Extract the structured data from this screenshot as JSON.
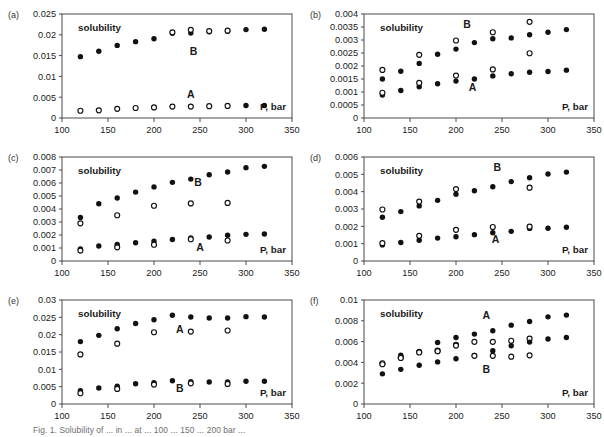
{
  "figure": {
    "width": 604,
    "height": 437,
    "caption": "Fig. 1. Solubility of ... in ... at ... 100 ... 150 ... 200 bar ...",
    "panel_order": [
      "a",
      "b",
      "c",
      "d",
      "e",
      "f"
    ]
  },
  "labels": {
    "solubility": "solubility",
    "pressure_axis": "P, bar",
    "series_a": "A",
    "series_b": "B"
  },
  "chart_data": [
    {
      "id": "a",
      "type": "scatter",
      "panel_letter": "(a)",
      "title": "",
      "xlabel": "P, bar",
      "ylabel": "solubility",
      "xlim": [
        100,
        350
      ],
      "ylim": [
        0,
        0.025
      ],
      "xticks": [
        100,
        150,
        200,
        250,
        300,
        350
      ],
      "yticks": [
        0,
        0.005,
        0.01,
        0.015,
        0.02,
        0.025
      ],
      "ytick_labels": [
        "0",
        "0.005",
        "0.01",
        "0.015",
        "0.02",
        "0.025"
      ],
      "grid": false,
      "legend": "none",
      "annotations": [
        {
          "text": "A",
          "x": 240,
          "y": 0.0048
        },
        {
          "text": "B",
          "x": 243,
          "y": 0.0152
        }
      ],
      "series": [
        {
          "name": "B-filled",
          "marker": "filled",
          "x": [
            120,
            140,
            160,
            180,
            200,
            220,
            240,
            260,
            280,
            300,
            320
          ],
          "values": [
            0.01475,
            0.01605,
            0.01745,
            0.01835,
            0.01905,
            0.02035,
            0.02045,
            0.02075,
            0.02085,
            0.02125,
            0.02135
          ]
        },
        {
          "name": "B-open",
          "marker": "open",
          "x": [
            220,
            240,
            260,
            280
          ],
          "values": [
            0.0206,
            0.0212,
            0.0209,
            0.021
          ]
        },
        {
          "name": "A-filled",
          "marker": "filled",
          "x": [
            300,
            320
          ],
          "values": [
            0.003,
            0.003
          ]
        },
        {
          "name": "A-open",
          "marker": "open",
          "x": [
            120,
            140,
            160,
            180,
            200,
            220,
            240,
            260,
            280
          ],
          "values": [
            0.00175,
            0.00185,
            0.0022,
            0.0024,
            0.00255,
            0.00275,
            0.00275,
            0.00285,
            0.0029
          ]
        }
      ]
    },
    {
      "id": "b",
      "type": "scatter",
      "panel_letter": "(b)",
      "title": "",
      "xlabel": "P, bar",
      "ylabel": "solubility",
      "xlim": [
        100,
        350
      ],
      "ylim": [
        0,
        0.004
      ],
      "xticks": [
        100,
        150,
        200,
        250,
        300,
        350
      ],
      "yticks": [
        0,
        0.0005,
        0.001,
        0.0015,
        0.002,
        0.0025,
        0.003,
        0.0035,
        0.004
      ],
      "ytick_labels": [
        "0",
        "0.0005",
        "0.001",
        "0.0015",
        "0.002",
        "0.0025",
        "0.003",
        "0.0035",
        "0.004"
      ],
      "grid": false,
      "legend": "none",
      "annotations": [
        {
          "text": "A",
          "x": 218,
          "y": 0.00105
        },
        {
          "text": "B",
          "x": 212,
          "y": 0.00345
        }
      ],
      "series": [
        {
          "name": "B-filled",
          "marker": "filled",
          "x": [
            120,
            140,
            160,
            180,
            200,
            220,
            240,
            260,
            280,
            300,
            320
          ],
          "values": [
            0.0015,
            0.0018,
            0.0021,
            0.00245,
            0.00265,
            0.0029,
            0.00305,
            0.00308,
            0.0032,
            0.0033,
            0.0034
          ]
        },
        {
          "name": "B-open",
          "marker": "open",
          "x": [
            120,
            160,
            200,
            240,
            280
          ],
          "values": [
            0.00185,
            0.00243,
            0.00298,
            0.0033,
            0.0037
          ]
        },
        {
          "name": "A-filled",
          "marker": "filled",
          "x": [
            120,
            140,
            160,
            180,
            200,
            220,
            240,
            260,
            280,
            300,
            320
          ],
          "values": [
            0.00088,
            0.00106,
            0.0012,
            0.00132,
            0.00142,
            0.0015,
            0.00162,
            0.0017,
            0.00176,
            0.00179,
            0.00184
          ]
        },
        {
          "name": "A-open",
          "marker": "open",
          "x": [
            120,
            160,
            200,
            240,
            280
          ],
          "values": [
            0.00097,
            0.00135,
            0.00163,
            0.00187,
            0.00249
          ]
        }
      ]
    },
    {
      "id": "c",
      "type": "scatter",
      "panel_letter": "(c)",
      "title": "",
      "xlabel": "P, bar",
      "ylabel": "solubility",
      "xlim": [
        100,
        350
      ],
      "ylim": [
        0,
        0.008
      ],
      "xticks": [
        100,
        150,
        200,
        250,
        300,
        350
      ],
      "yticks": [
        0,
        0.001,
        0.002,
        0.003,
        0.004,
        0.005,
        0.006,
        0.007,
        0.008
      ],
      "ytick_labels": [
        "0",
        "0.001",
        "0.002",
        "0.003",
        "0.004",
        "0.005",
        "0.006",
        "0.007",
        "0.008"
      ],
      "grid": false,
      "legend": "none",
      "annotations": [
        {
          "text": "A",
          "x": 250,
          "y": 0.00075
        },
        {
          "text": "B",
          "x": 248,
          "y": 0.0058
        }
      ],
      "series": [
        {
          "name": "B-filled",
          "marker": "filled",
          "x": [
            120,
            140,
            160,
            180,
            200,
            220,
            240,
            260,
            280,
            300,
            320
          ],
          "values": [
            0.00335,
            0.0044,
            0.00485,
            0.0053,
            0.0057,
            0.00605,
            0.0063,
            0.00663,
            0.00685,
            0.00718,
            0.00728
          ]
        },
        {
          "name": "B-open",
          "marker": "open",
          "x": [
            120,
            160,
            200,
            240,
            280
          ],
          "values": [
            0.0029,
            0.00352,
            0.00425,
            0.00443,
            0.00447
          ]
        },
        {
          "name": "A-filled",
          "marker": "filled",
          "x": [
            120,
            140,
            160,
            180,
            200,
            220,
            240,
            260,
            280,
            300,
            320
          ],
          "values": [
            0.00092,
            0.00115,
            0.00128,
            0.0014,
            0.00152,
            0.00165,
            0.00178,
            0.00185,
            0.00198,
            0.00205,
            0.00208
          ]
        },
        {
          "name": "A-open",
          "marker": "open",
          "x": [
            120,
            160,
            200,
            240,
            280
          ],
          "values": [
            0.0008,
            0.00105,
            0.00125,
            0.00167,
            0.00158
          ]
        }
      ]
    },
    {
      "id": "d",
      "type": "scatter",
      "panel_letter": "(d)",
      "title": "",
      "xlabel": "P, bar",
      "ylabel": "solubility",
      "xlim": [
        100,
        350
      ],
      "ylim": [
        0,
        0.006
      ],
      "xticks": [
        100,
        150,
        200,
        250,
        300,
        350
      ],
      "yticks": [
        0,
        0.001,
        0.002,
        0.003,
        0.004,
        0.005,
        0.006
      ],
      "ytick_labels": [
        "0",
        "0.001",
        "0.002",
        "0.003",
        "0.004",
        "0.005",
        "0.006"
      ],
      "grid": false,
      "legend": "none",
      "annotations": [
        {
          "text": "A",
          "x": 243,
          "y": 0.00105
        },
        {
          "text": "B",
          "x": 245,
          "y": 0.0052
        }
      ],
      "series": [
        {
          "name": "B-filled",
          "marker": "filled",
          "x": [
            120,
            140,
            160,
            180,
            200,
            220,
            240,
            260,
            280,
            300,
            320
          ],
          "values": [
            0.00252,
            0.00285,
            0.00318,
            0.0035,
            0.00385,
            0.00405,
            0.00428,
            0.00458,
            0.0048,
            0.00502,
            0.00513
          ]
        },
        {
          "name": "B-open",
          "marker": "open",
          "x": [
            120,
            160,
            200,
            280
          ],
          "values": [
            0.00297,
            0.00343,
            0.00415,
            0.00423
          ]
        },
        {
          "name": "A-filled",
          "marker": "filled",
          "x": [
            120,
            140,
            160,
            180,
            200,
            220,
            240,
            260,
            280,
            300,
            320
          ],
          "values": [
            0.00093,
            0.00107,
            0.0012,
            0.00132,
            0.0014,
            0.00152,
            0.00163,
            0.00171,
            0.00188,
            0.00189,
            0.00195
          ]
        },
        {
          "name": "A-open",
          "marker": "open",
          "x": [
            120,
            160,
            200,
            240,
            280
          ],
          "values": [
            0.00103,
            0.00145,
            0.0018,
            0.00196,
            0.00198
          ]
        }
      ]
    },
    {
      "id": "e",
      "type": "scatter",
      "panel_letter": "(e)",
      "title": "",
      "xlabel": "P, bar",
      "ylabel": "solubility",
      "xlim": [
        100,
        350
      ],
      "ylim": [
        0,
        0.03
      ],
      "xticks": [
        100,
        150,
        200,
        250,
        300,
        350
      ],
      "yticks": [
        0,
        0.005,
        0.01,
        0.015,
        0.02,
        0.025,
        0.03
      ],
      "ytick_labels": [
        "0",
        "0.005",
        "0.01",
        "0.015",
        "0.02",
        "0.025",
        "0.03"
      ],
      "grid": false,
      "legend": "none",
      "annotations": [
        {
          "text": "A",
          "x": 228,
          "y": 0.0205
        },
        {
          "text": "B",
          "x": 228,
          "y": 0.0035
        }
      ],
      "series": [
        {
          "name": "A-filled",
          "marker": "filled",
          "x": [
            120,
            140,
            160,
            180,
            200,
            220,
            240,
            260,
            280,
            300,
            320
          ],
          "values": [
            0.018,
            0.0198,
            0.0217,
            0.0232,
            0.0243,
            0.0256,
            0.0251,
            0.0248,
            0.0248,
            0.0252,
            0.0251
          ]
        },
        {
          "name": "A-open",
          "marker": "open",
          "x": [
            120,
            160,
            200,
            240,
            280
          ],
          "values": [
            0.0143,
            0.0174,
            0.0207,
            0.0209,
            0.0212
          ]
        },
        {
          "name": "B-filled",
          "marker": "filled",
          "x": [
            120,
            140,
            160,
            180,
            200,
            220,
            240,
            260,
            280,
            300,
            320
          ],
          "values": [
            0.00383,
            0.00462,
            0.0051,
            0.00585,
            0.00618,
            0.00672,
            0.0064,
            0.00635,
            0.00635,
            0.00655,
            0.00655
          ]
        },
        {
          "name": "B-open",
          "marker": "open",
          "x": [
            120,
            160,
            200,
            240,
            280
          ],
          "values": [
            0.0031,
            0.00435,
            0.0056,
            0.00595,
            0.0058
          ]
        }
      ]
    },
    {
      "id": "f",
      "type": "scatter",
      "panel_letter": "(f)",
      "title": "",
      "xlabel": "P, bar",
      "ylabel": "solubility",
      "xlim": [
        100,
        350
      ],
      "ylim": [
        0,
        0.01
      ],
      "xticks": [
        100,
        150,
        200,
        250,
        300,
        350
      ],
      "yticks": [
        0,
        0.002,
        0.004,
        0.006,
        0.008,
        0.01
      ],
      "ytick_labels": [
        "0",
        "0.002",
        "0.004",
        "0.006",
        "0.008",
        "0.01"
      ],
      "grid": false,
      "legend": "none",
      "annotations": [
        {
          "text": "A",
          "x": 233,
          "y": 0.0082
        },
        {
          "text": "B",
          "x": 233,
          "y": 0.003
        }
      ],
      "series": [
        {
          "name": "A-filled",
          "marker": "filled",
          "x": [
            120,
            140,
            160,
            180,
            200,
            220,
            240,
            260,
            280,
            300,
            320
          ],
          "values": [
            0.00385,
            0.0047,
            0.00505,
            0.00592,
            0.0064,
            0.00672,
            0.00705,
            0.00758,
            0.00793,
            0.00838,
            0.00855
          ]
        },
        {
          "name": "A-open",
          "marker": "open",
          "x": [
            120,
            140,
            160,
            180,
            200,
            220,
            240,
            260,
            280
          ],
          "values": [
            0.00392,
            0.00448,
            0.005,
            0.00513,
            0.0057,
            0.00598,
            0.00598,
            0.00608,
            0.00628
          ]
        },
        {
          "name": "B-filled",
          "marker": "filled",
          "x": [
            120,
            140,
            160,
            180,
            200,
            220,
            240,
            260,
            280,
            300,
            320
          ],
          "values": [
            0.0029,
            0.00333,
            0.00372,
            0.00405,
            0.00435,
            0.00468,
            0.00513,
            0.0056,
            0.00595,
            0.00625,
            0.0064
          ]
        },
        {
          "name": "B-open",
          "marker": "open",
          "x": [
            120,
            140,
            160,
            180,
            200,
            220,
            240,
            260,
            280
          ],
          "values": [
            0.00382,
            0.00442,
            0.00495,
            0.00508,
            0.00562,
            0.00463,
            0.00463,
            0.00455,
            0.00468
          ]
        }
      ]
    }
  ]
}
